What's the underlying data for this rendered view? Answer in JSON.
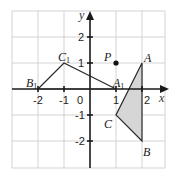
{
  "diagram": {
    "type": "coordinate-geometry",
    "axes": {
      "x_label": "x",
      "y_label": "y",
      "origin_label": "0"
    },
    "x_ticks": [
      "-2",
      "-1",
      "1",
      "2"
    ],
    "y_ticks": [
      "2",
      "1",
      "-1",
      "-2"
    ],
    "grid": {
      "x_range": [
        -3,
        3
      ],
      "y_range": [
        -3,
        3
      ]
    },
    "points": {
      "P": {
        "label": "P",
        "x": 1,
        "y": 1
      },
      "A": {
        "label": "A",
        "x": 2,
        "y": 1
      },
      "B": {
        "label": "B",
        "x": 2,
        "y": -2
      },
      "C": {
        "label": "C",
        "x": 1,
        "y": -1
      },
      "A1": {
        "label": "A",
        "sub": "1",
        "x": 1,
        "y": 0
      },
      "B1": {
        "label": "B",
        "sub": "1",
        "x": -2,
        "y": 0
      },
      "C1": {
        "label": "C",
        "sub": "1",
        "x": -1,
        "y": 1
      }
    },
    "triangles": [
      {
        "name": "ABC",
        "vertices": [
          "A",
          "B",
          "C"
        ],
        "shaded": true,
        "fill": "#d6d6d6"
      },
      {
        "name": "A1B1C1",
        "vertices": [
          "A1",
          "B1",
          "C1"
        ],
        "shaded": false
      }
    ]
  }
}
